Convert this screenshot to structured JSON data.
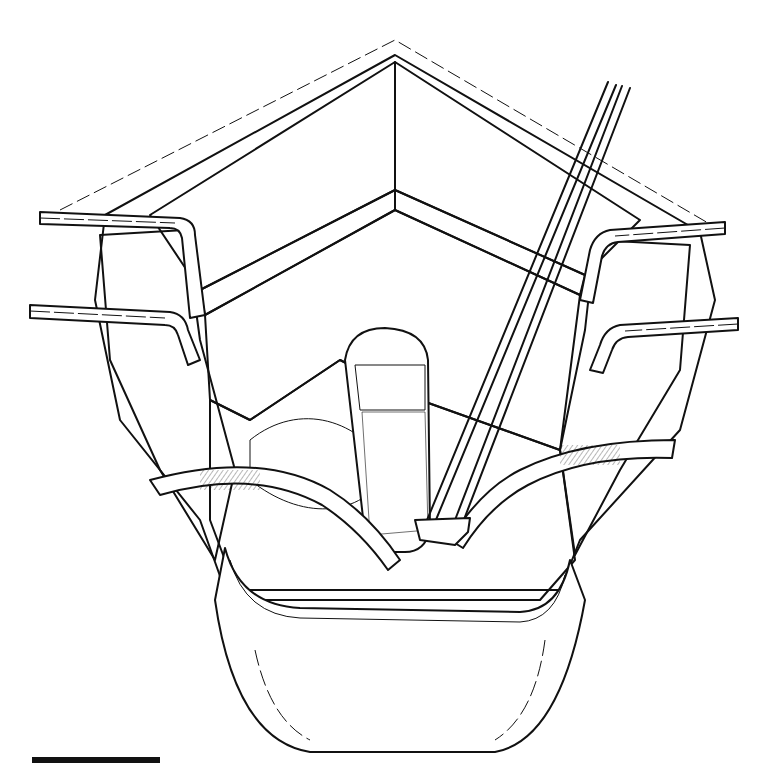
{
  "figure": {
    "type": "surgical line illustration",
    "ink_color": "#111111",
    "background_color": "#ffffff",
    "labels": []
  },
  "scale_bar": {
    "x": 32,
    "y": 757,
    "width": 128,
    "height": 6,
    "label": ""
  }
}
